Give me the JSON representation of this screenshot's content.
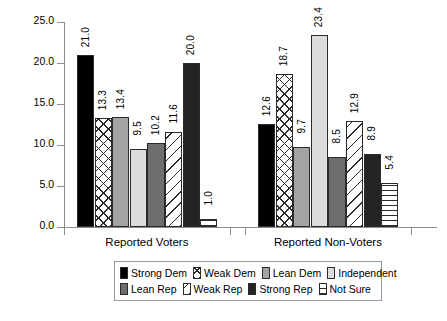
{
  "chart_data": {
    "type": "bar",
    "title": "",
    "subtitle": "",
    "xlabel": "",
    "ylabel": "Group Percentages",
    "ylim": [
      0,
      25
    ],
    "ytick_labels": [
      "25.0",
      "20.0",
      "15.0",
      "10.0",
      "5.0",
      "0.0"
    ],
    "ytick_values": [
      25.0,
      20.0,
      15.0,
      10.0,
      5.0,
      0.0
    ],
    "grid": false,
    "legend_position": "bottom",
    "categories": [
      "Reported Voters",
      "Reported Non-Voters"
    ],
    "series": [
      {
        "name": "Strong Dem",
        "values": [
          21.0,
          12.6
        ],
        "swatch": "fill-strong-dem",
        "color": "#000000"
      },
      {
        "name": "Weak Dem",
        "values": [
          13.3,
          18.7
        ],
        "swatch": "fill-weak-dem",
        "color": "#ffffff"
      },
      {
        "name": "Lean Dem",
        "values": [
          13.4,
          9.7
        ],
        "swatch": "fill-lean-dem",
        "color": "#a3a3a3"
      },
      {
        "name": "Independent",
        "values": [
          9.5,
          23.4
        ],
        "swatch": "fill-independent",
        "color": "#dcdcdc"
      },
      {
        "name": "Lean Rep",
        "values": [
          10.2,
          8.5
        ],
        "swatch": "fill-lean-rep",
        "color": "#6e6e6e"
      },
      {
        "name": "Weak Rep",
        "values": [
          11.6,
          12.9
        ],
        "swatch": "fill-weak-rep",
        "color": "#ffffff"
      },
      {
        "name": "Strong Rep",
        "values": [
          20.0,
          8.9
        ],
        "swatch": "fill-strong-rep",
        "color": "#242424"
      },
      {
        "name": "Not Sure",
        "values": [
          1.0,
          5.4
        ],
        "swatch": "fill-not-sure",
        "color": "#ffffff"
      }
    ],
    "value_labels": {
      "Reported Voters": [
        "21.0",
        "13.3",
        "13.4",
        "9.5",
        "10.2",
        "11.6",
        "20.0",
        "1.0"
      ],
      "Reported Non-Voters": [
        "12.6",
        "18.7",
        "9.7",
        "23.4",
        "8.5",
        "12.9",
        "8.9",
        "5.4"
      ]
    }
  },
  "legend": {
    "row1": [
      "Strong Dem",
      "Weak Dem",
      "Lean Dem",
      "Independent"
    ],
    "row2": [
      "Lean Rep",
      "Weak Rep",
      "Strong Rep",
      "Not Sure"
    ]
  }
}
